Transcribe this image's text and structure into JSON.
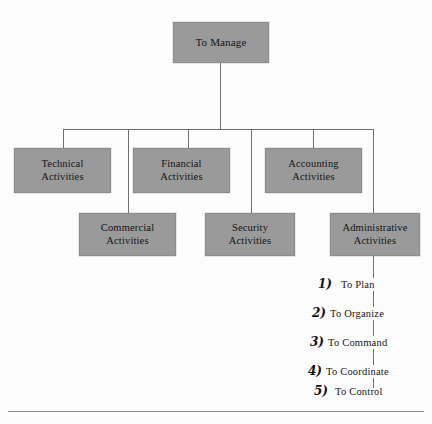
{
  "figure": {
    "type": "organizational-hierarchy-diagram",
    "background_color": "#fdfdfd",
    "node_fill_color": "#9a9a9a",
    "line_color": "#6f6f6f"
  },
  "root": {
    "label": "To Manage"
  },
  "row2": [
    {
      "label": "Technical\nActivities"
    },
    {
      "label": "Financial\nActivities"
    },
    {
      "label": "Accounting\nActivities"
    }
  ],
  "row3": [
    {
      "label": "Commercial\nActivities"
    },
    {
      "label": "Security\nActivities"
    },
    {
      "label": "Administrative\nActivities"
    }
  ],
  "numbered_list": [
    {
      "number": "1)",
      "text": "To Plan"
    },
    {
      "number": "2)",
      "text": "To Organize"
    },
    {
      "number": "3)",
      "text": "To Command"
    },
    {
      "number": "4)",
      "text": "To Coordinate"
    },
    {
      "number": "5)",
      "text": "To Control"
    }
  ]
}
